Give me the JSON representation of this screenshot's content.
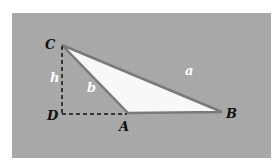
{
  "diagram": {
    "colors": {
      "panel": "#a8a8a8",
      "triangle_fill": "#f8f8f8",
      "triangle_edge": "#7a7a7a",
      "dashed": "#111111",
      "vertex_label": "#111111",
      "side_label": "#ffffff"
    },
    "vertices": {
      "C": "C",
      "D": "D",
      "A": "A",
      "B": "B"
    },
    "sides": {
      "a": "a",
      "b": "b",
      "h": "h"
    }
  }
}
